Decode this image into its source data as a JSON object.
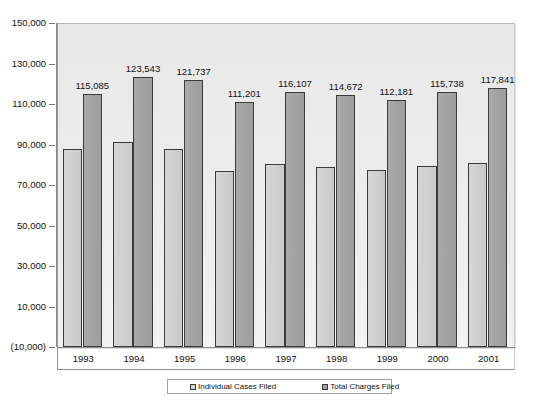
{
  "chart_data": {
    "type": "bar",
    "title": "",
    "subtitle": "",
    "xlabel": "",
    "ylabel": "",
    "categories": [
      "1993",
      "1994",
      "1995",
      "1996",
      "1997",
      "1998",
      "1999",
      "2000",
      "2001"
    ],
    "series": [
      {
        "name": "Individual Cases Filed",
        "color": "#d0d0d0",
        "values": [
          88000,
          91000,
          88000,
          77000,
          80500,
          79000,
          77500,
          79500,
          81000
        ],
        "labels": [
          "",
          "",
          "",
          "",
          "",
          "",
          "",
          "",
          ""
        ]
      },
      {
        "name": "Total Charges Filed",
        "color": "#a3a3a3",
        "values": [
          115085,
          123543,
          121737,
          111201,
          116107,
          114672,
          112181,
          115738,
          117841
        ],
        "labels": [
          "115,085",
          "123,543",
          "121,737",
          "111,201",
          "116,107",
          "114,672",
          "112,181",
          "115,738",
          "117,841"
        ]
      }
    ],
    "yticks": [
      150000,
      130000,
      110000,
      90000,
      70000,
      50000,
      30000,
      10000,
      -10000
    ],
    "ytick_labels": [
      "150,000",
      "130,000",
      "110,000",
      "90,000",
      "70,000",
      "50,000",
      "30,000",
      "10,000",
      "(10,000)"
    ],
    "ylim": [
      -10000,
      150000
    ],
    "grid": false,
    "legend_position": "bottom",
    "legend": [
      {
        "label": "Individual Cases Filed",
        "swatch": "series-a"
      },
      {
        "label": "Total Charges Filed",
        "swatch": "series-b"
      }
    ]
  }
}
